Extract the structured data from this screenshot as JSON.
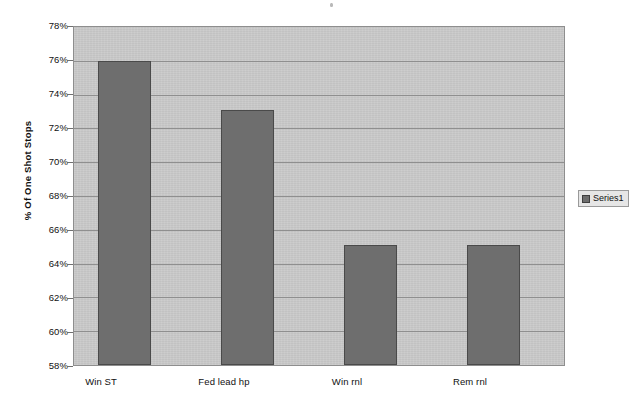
{
  "chart_data": {
    "type": "bar",
    "title": "",
    "subtitle": "",
    "xlabel": "",
    "ylabel": "% Of One Shot Stops",
    "categories": [
      "Win ST",
      "Fed lead hp",
      "Win rnl",
      "Rem rnl"
    ],
    "values": [
      76.0,
      73.1,
      65.1,
      65.1
    ],
    "series": [
      {
        "name": "Series1",
        "values": [
          76.0,
          73.1,
          65.1,
          65.1
        ],
        "color": "#6e6e6e"
      }
    ],
    "ylim": [
      58,
      78
    ],
    "ytick_step": 2,
    "ytick_labels": [
      "78%",
      "76%",
      "74%",
      "72%",
      "70%",
      "68%",
      "66%",
      "64%",
      "62%",
      "60%",
      "58%"
    ],
    "ytick_values": [
      78,
      76,
      74,
      72,
      70,
      68,
      66,
      64,
      62,
      60,
      58
    ],
    "grid": true,
    "grid_axis": "y",
    "legend_position": "right",
    "plot_background": "#c9c9c9",
    "page_background": "#ffffff",
    "bar_color": "#6e6e6e",
    "bar_border_color": "#4a4a4a",
    "gridline_color": "#8f8f8f"
  },
  "legend": {
    "entries": [
      {
        "label": "Series1",
        "color": "#6e6e6e"
      }
    ]
  }
}
